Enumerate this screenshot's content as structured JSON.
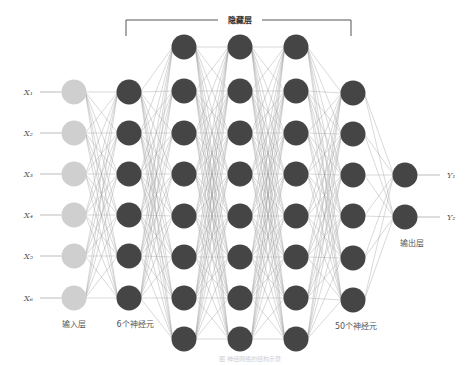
{
  "diagram": {
    "title": "隐藏层",
    "caption": "图 神经网络的结构示意",
    "colors": {
      "input_node": "#cfcfcf",
      "hidden_node": "#454545",
      "output_node": "#454545",
      "edge": "#9a9a9a",
      "bracket": "#555555",
      "label": "#555555"
    },
    "node_radius": 12.5,
    "layers": [
      {
        "name": "input",
        "label": "输入层",
        "x": 74,
        "ys": [
          92,
          133,
          174,
          215,
          256,
          298
        ],
        "type": "input"
      },
      {
        "name": "hidden-1",
        "label": "6个神经元",
        "x": 129,
        "ys": [
          92,
          133,
          174,
          215,
          256,
          298
        ],
        "type": "hidden"
      },
      {
        "name": "hidden-2",
        "label": "",
        "x": 184,
        "ys": [
          47,
          91,
          133,
          174,
          216,
          257,
          298,
          339
        ],
        "type": "hidden"
      },
      {
        "name": "hidden-3",
        "label": "",
        "x": 240,
        "ys": [
          47,
          91,
          133,
          174,
          216,
          257,
          298,
          339
        ],
        "type": "hidden"
      },
      {
        "name": "hidden-4",
        "label": "",
        "x": 296,
        "ys": [
          47,
          91,
          133,
          174,
          216,
          257,
          298,
          339
        ],
        "type": "hidden"
      },
      {
        "name": "hidden-5",
        "label": "50个神经元",
        "x": 353,
        "ys": [
          93,
          134,
          175,
          216,
          258,
          300
        ],
        "type": "hidden"
      },
      {
        "name": "output",
        "label": "输出层",
        "x": 405,
        "ys": [
          175,
          217
        ],
        "type": "output"
      }
    ],
    "inputs": [
      {
        "label": "X₁",
        "y": 92
      },
      {
        "label": "X₂",
        "y": 133
      },
      {
        "label": "X₃",
        "y": 174
      },
      {
        "label": "X₄",
        "y": 215
      },
      {
        "label": "X₅",
        "y": 256
      },
      {
        "label": "X₆",
        "y": 298
      }
    ],
    "outputs": [
      {
        "label": "Y₁",
        "y": 175
      },
      {
        "label": "Y₂",
        "y": 217
      }
    ],
    "layer_labels": [
      {
        "text": "输入层",
        "x": 74,
        "y": 327
      },
      {
        "text": "6个神经元",
        "x": 135,
        "y": 327
      },
      {
        "text": "50个神经元",
        "x": 356,
        "y": 329
      },
      {
        "text": "输出层",
        "x": 412,
        "y": 246
      }
    ],
    "bracket": {
      "x1": 126,
      "x2": 351,
      "y": 20,
      "drop": 16,
      "title_x": 240
    }
  }
}
